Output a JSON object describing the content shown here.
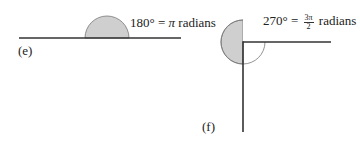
{
  "figures": [
    {
      "id": "e",
      "label": "(e)",
      "angle_text_deg": "180° = ",
      "angle_text_sym": "π",
      "angle_text_unit": " radians",
      "angle_degrees": 180
    },
    {
      "id": "f",
      "label": "(f)",
      "angle_text_deg": "270° = ",
      "frac_num": "3π",
      "frac_den": "2",
      "angle_text_unit": " radians",
      "angle_degrees": 270
    }
  ],
  "colors": {
    "line": "#333333",
    "arc_fill": "#cfcfcf",
    "arc_stroke": "#777777"
  }
}
